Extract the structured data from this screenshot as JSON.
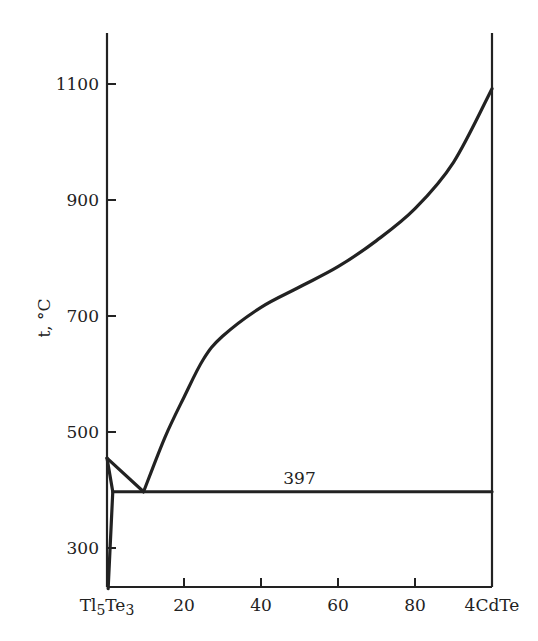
{
  "chart_data": {
    "type": "line",
    "title": "",
    "xlabel": "",
    "ylabel": "t, °C",
    "xlim": [
      0,
      100
    ],
    "ylim": [
      230,
      1190
    ],
    "grid": false,
    "x_ticks": [
      {
        "value": 0,
        "label": "Tl5Te3"
      },
      {
        "value": 20,
        "label": "20"
      },
      {
        "value": 40,
        "label": "40"
      },
      {
        "value": 60,
        "label": "60"
      },
      {
        "value": 80,
        "label": "80"
      },
      {
        "value": 100,
        "label": "4CdTe"
      }
    ],
    "y_ticks": [
      300,
      500,
      700,
      900,
      1100
    ],
    "x_components": {
      "left": "Tl5Te3",
      "right": "4CdTe"
    },
    "annotations": [
      {
        "text": "397",
        "x": 50,
        "y": 397,
        "meaning": "eutectic temperature"
      }
    ],
    "series": [
      {
        "name": "liquidus-Tl5Te3-side",
        "x": [
          0,
          9.5
        ],
        "y": [
          455,
          397
        ]
      },
      {
        "name": "liquidus-CdTe-side",
        "x": [
          9.5,
          15,
          20,
          25,
          30,
          40,
          50,
          60,
          70,
          80,
          90,
          100
        ],
        "y": [
          397,
          490,
          560,
          625,
          665,
          715,
          750,
          785,
          830,
          885,
          965,
          1092
        ]
      },
      {
        "name": "eutectic-line",
        "x": [
          1.5,
          100
        ],
        "y": [
          397,
          397
        ]
      },
      {
        "name": "solidus-Tl5Te3-solid-solution",
        "x": [
          0,
          1.5,
          0.3
        ],
        "y": [
          455,
          397,
          230
        ]
      }
    ]
  }
}
